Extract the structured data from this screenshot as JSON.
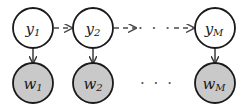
{
  "figure": {
    "type": "probabilistic-graphical-model",
    "background_color": "#ffffff",
    "width": 245,
    "height": 111
  },
  "style": {
    "latent_node_fill": "#ffffff",
    "observed_node_fill": "#c9c9c9",
    "node_stroke": "#1a1a1a",
    "arrow_color": "#4a4a4a",
    "label_color": "#1a1a1a",
    "ellipsis_color": "#4d4d4d"
  },
  "nodes": {
    "latent_row": [
      {
        "name": "latent-node-1",
        "base": "y",
        "subscript": "1",
        "cx": 33,
        "cy": 28,
        "r": 20,
        "shaded": false
      },
      {
        "name": "latent-node-2",
        "base": "y",
        "subscript": "2",
        "cx": 93,
        "cy": 28,
        "r": 20,
        "shaded": false
      },
      {
        "name": "latent-node-M",
        "base": "y",
        "subscript": "M",
        "cx": 215,
        "cy": 28,
        "r": 20,
        "shaded": false
      }
    ],
    "observed_row": [
      {
        "name": "observed-node-1",
        "base": "w",
        "subscript": "1",
        "cx": 33,
        "cy": 83,
        "r": 20,
        "shaded": true
      },
      {
        "name": "observed-node-2",
        "base": "w",
        "subscript": "2",
        "cx": 93,
        "cy": 83,
        "r": 20,
        "shaded": true
      },
      {
        "name": "observed-node-M",
        "base": "w",
        "subscript": "M",
        "cx": 215,
        "cy": 83,
        "r": 20,
        "shaded": true
      }
    ]
  },
  "edges": {
    "horizontal_dashed": [
      {
        "name": "edge-y1-to-y2",
        "x1": 54,
        "x2": 72,
        "y": 28,
        "dashed": true,
        "arrowhead": true
      },
      {
        "name": "edge-y2-to-dots",
        "x1": 114,
        "x2": 136,
        "y": 28,
        "dashed": true,
        "arrowhead": true
      },
      {
        "name": "edge-dots-to-yM",
        "x1": 174,
        "x2": 194,
        "y": 28,
        "dashed": true,
        "arrowhead": true
      }
    ],
    "vertical_solid": [
      {
        "name": "edge-y1-to-w1",
        "x": 33,
        "y1": 48,
        "y2": 63,
        "dashed": false,
        "arrowhead": true
      },
      {
        "name": "edge-y2-to-w2",
        "x": 93,
        "y1": 48,
        "y2": 63,
        "dashed": false,
        "arrowhead": true
      },
      {
        "name": "edge-yM-to-wM",
        "x": 215,
        "y1": 48,
        "y2": 63,
        "dashed": false,
        "arrowhead": true
      }
    ]
  },
  "ellipses": [
    {
      "name": "ellipsis-top-row",
      "text": "· · ·",
      "cx": 155,
      "cy": 28
    },
    {
      "name": "ellipsis-bottom-row",
      "text": "· · ·",
      "cx": 157,
      "cy": 83
    }
  ]
}
